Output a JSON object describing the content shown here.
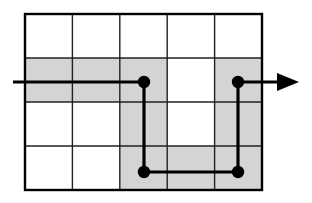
{
  "figure": {
    "canvas": {
      "width": 312,
      "height": 203,
      "background": "#ffffff"
    },
    "colors": {
      "grid_line": "#231f20",
      "grid_border": "#000000",
      "shaded_cell": "#d4d4d4",
      "path_line": "#000000",
      "node_fill": "#000000",
      "background": "#ffffff"
    },
    "grid": {
      "columns": 5,
      "rows": 4,
      "left": 25,
      "top": 14,
      "right": 262,
      "bottom": 190,
      "cell_width": 47.4,
      "cell_height": 44,
      "border_width": 2.4,
      "inner_line_width": 1.4,
      "column_x": [
        25,
        72.4,
        119.8,
        167.2,
        214.6,
        262
      ],
      "row_y": [
        14,
        58,
        102,
        146,
        190
      ]
    },
    "shaded_cells": [
      {
        "row": 2,
        "col": 1
      },
      {
        "row": 2,
        "col": 2
      },
      {
        "row": 2,
        "col": 3
      },
      {
        "row": 2,
        "col": 5
      },
      {
        "row": 3,
        "col": 3
      },
      {
        "row": 3,
        "col": 5
      },
      {
        "row": 4,
        "col": 3
      },
      {
        "row": 4,
        "col": 4
      },
      {
        "row": 4,
        "col": 5
      }
    ],
    "path": {
      "stroke_width": 3.2,
      "entry": {
        "x": 13,
        "y": 82
      },
      "exit": {
        "x": 299,
        "y": 82
      },
      "arrowhead": {
        "tip_x": 299,
        "base_x": 277,
        "y": 82,
        "half_height": 9
      },
      "points": [
        {
          "x": 13,
          "y": 82
        },
        {
          "x": 144,
          "y": 82
        },
        {
          "x": 144,
          "y": 172
        },
        {
          "x": 238,
          "y": 172
        },
        {
          "x": 238,
          "y": 82
        },
        {
          "x": 299,
          "y": 82
        }
      ]
    },
    "nodes": [
      {
        "id": "node-top-left",
        "x": 144,
        "y": 82,
        "radius": 6.2
      },
      {
        "id": "node-top-right",
        "x": 238,
        "y": 82,
        "radius": 6.2
      },
      {
        "id": "node-bottom-left",
        "x": 144,
        "y": 172,
        "radius": 6.2
      },
      {
        "id": "node-bottom-right",
        "x": 238,
        "y": 172,
        "radius": 6.2
      }
    ]
  }
}
